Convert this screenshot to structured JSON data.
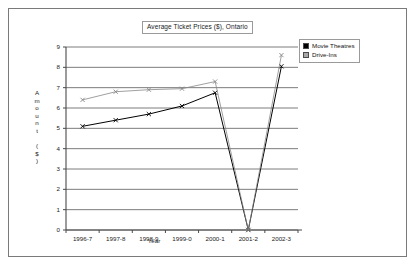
{
  "chart_data": {
    "type": "line",
    "title": "Average Ticket Prices ($), Ontario",
    "xlabel": "Year",
    "ylabel": "Amount ($)",
    "categories": [
      "1996-7",
      "1997-8",
      "1998-9",
      "1999-0",
      "2000-1",
      "2001-2",
      "2002-3"
    ],
    "series": [
      {
        "name": "Movie Theatres",
        "color": "#000000",
        "marker": "x",
        "values": [
          5.1,
          5.4,
          5.7,
          6.1,
          6.75,
          0.0,
          8.05
        ]
      },
      {
        "name": "Drive-Ins",
        "color": "#808080",
        "marker": "x",
        "values": [
          6.4,
          6.8,
          6.9,
          6.95,
          7.3,
          0.0,
          8.6
        ]
      }
    ],
    "ylim": [
      0,
      9
    ],
    "yticks": [
      0,
      1,
      2,
      3,
      4,
      5,
      6,
      7,
      8,
      9
    ],
    "ytick_labels": [
      "0",
      "1",
      "2",
      "3",
      "4",
      "5",
      "6",
      "7",
      "8",
      "9"
    ],
    "grid": true,
    "grid_axis": "y",
    "legend_position": "top-right"
  },
  "legend": {
    "entries": [
      {
        "label": "Movie Theatres",
        "swatch_color": "#000000"
      },
      {
        "label": "Drive-Ins",
        "swatch_color": "#a0a0a0"
      }
    ]
  },
  "y_axis_title_chars": [
    "A",
    "m",
    "o",
    "u",
    "n",
    "t",
    "",
    "(",
    "$",
    ")"
  ],
  "colors": {
    "frame_border": "#7a7a7a",
    "plot_background": "#ffffff",
    "gridline": "#5a5a5a",
    "axis": "#4a4a4a",
    "series_movie_theatres": "#000000",
    "series_drive_ins": "#888888"
  }
}
